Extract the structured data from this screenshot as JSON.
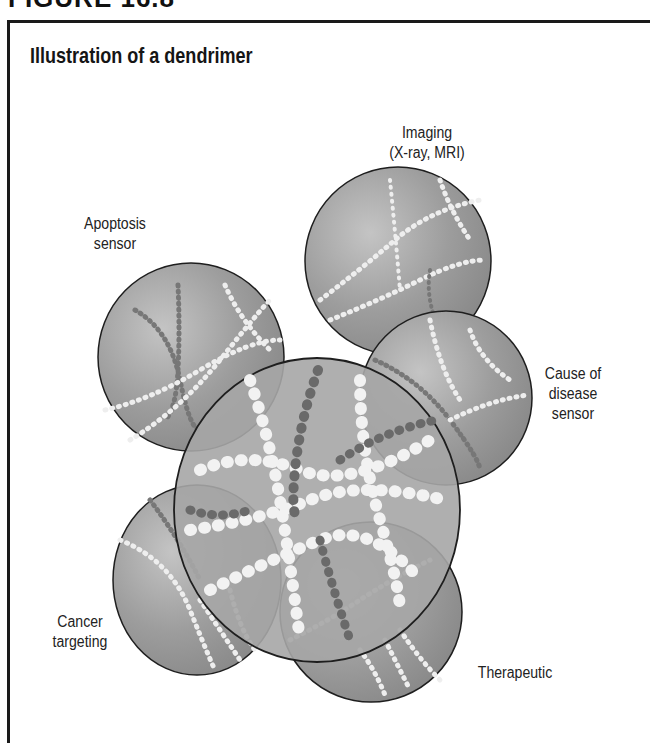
{
  "figure": {
    "heading": "FIGURE 16.8",
    "title": "Illustration of a dendrimer"
  },
  "labels": {
    "imaging": {
      "line1": "Imaging",
      "line2": "(X-ray, MRI)"
    },
    "apoptosis": {
      "line1": "Apoptosis",
      "line2": "sensor"
    },
    "cause": {
      "line1": "Cause of",
      "line2": "disease",
      "line3": "sensor"
    },
    "cancer": {
      "line1": "Cancer",
      "line2": "targeting"
    },
    "therapeutic": {
      "line1": "Therapeutic"
    }
  },
  "colors": {
    "sphere_fill": "#9a9a9a",
    "sphere_edge": "#1e1e1e",
    "bead_light": "#f4f4f4",
    "bead_dark": "#6e6e6e"
  }
}
